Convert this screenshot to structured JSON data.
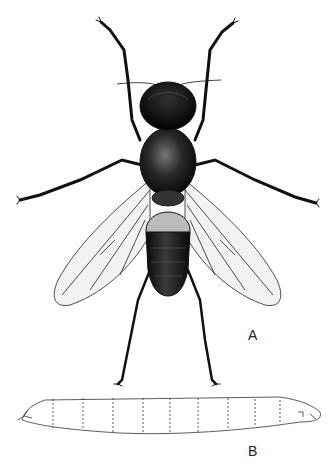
{
  "figure": {
    "panels": [
      {
        "id": "A",
        "label": "A",
        "subject": "adult fly, dorsal view"
      },
      {
        "id": "B",
        "label": "B",
        "subject": "larva, lateral view"
      }
    ],
    "colors": {
      "ink": "#111111",
      "background": "#ffffff",
      "wing_fill": "#f2f2f2"
    }
  }
}
